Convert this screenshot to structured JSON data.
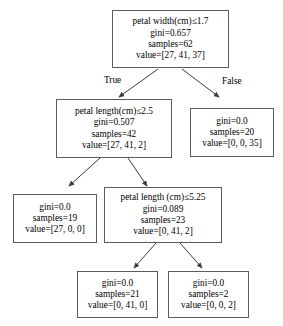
{
  "diagram": {
    "type": "decision-tree",
    "title": "",
    "nodes": [
      {
        "id": "root",
        "condition": "petal width(cm)≤1.7",
        "gini": "gini=0.657",
        "samples": "samples=62",
        "value": "value=[27, 41, 37]",
        "is_leaf": false
      },
      {
        "id": "left",
        "condition": "petal length(cm)≤2.5",
        "gini": "gini=0.507",
        "samples": "samples=42",
        "value": "value=[27, 41, 2]",
        "is_leaf": false
      },
      {
        "id": "right",
        "condition": "",
        "gini": "gini=0.0",
        "samples": "samples=20",
        "value": "value=[0, 0, 35]",
        "is_leaf": true
      },
      {
        "id": "left-left",
        "condition": "",
        "gini": "gini=0.0",
        "samples": "samples=19",
        "value": "value=[27, 0, 0]",
        "is_leaf": true
      },
      {
        "id": "left-right",
        "condition": "petal length (cm)≤5.25",
        "gini": "gini=0.089",
        "samples": "samples=23",
        "value": "value=[0, 41, 2]",
        "is_leaf": false
      },
      {
        "id": "left-right-left",
        "condition": "",
        "gini": "gini=0.0",
        "samples": "samples=21",
        "value": "value=[0, 41, 0]",
        "is_leaf": true
      },
      {
        "id": "left-right-right",
        "condition": "",
        "gini": "gini=0.0",
        "samples": "samples=2",
        "value": "value=[0, 0, 2]",
        "is_leaf": true
      }
    ],
    "edge_labels": {
      "true_label": "True",
      "false_label": "False"
    },
    "colors": {
      "box_border": "#5b5b5b",
      "edge_line": "#3c3c3c",
      "text": "#000000",
      "background": "#ffffff"
    }
  }
}
